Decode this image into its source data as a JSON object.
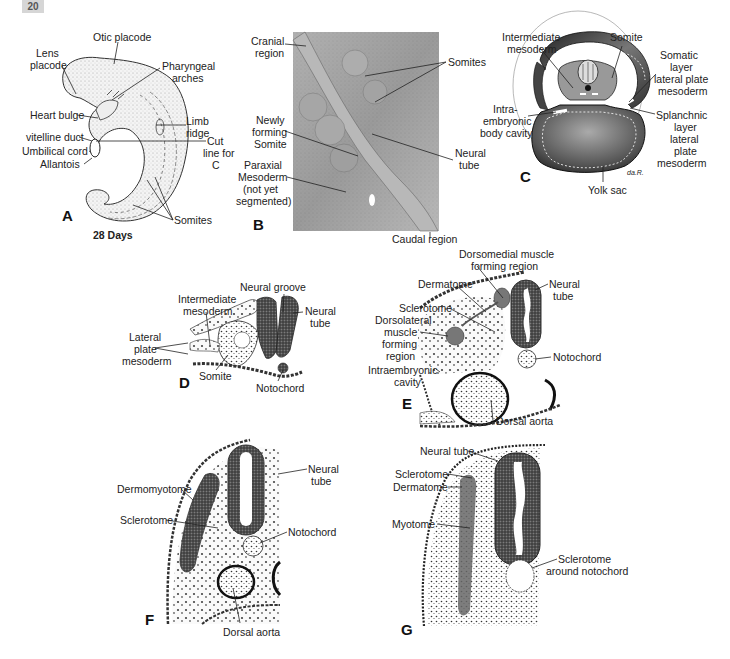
{
  "page": {
    "number": "20"
  },
  "panels": {
    "A": {
      "letter": "A",
      "caption": "28 Days",
      "labels": {
        "otic_placode": "Otic placode",
        "lens_placode_1": "Lens",
        "lens_placode_2": "placode",
        "pharyngeal_1": "Pharyngeal",
        "pharyngeal_2": "arches",
        "heart_bulge": "Heart bulge",
        "limb_ridge_1": "Limb",
        "limb_ridge_2": "ridge",
        "vitelline_duct": "vitelline duct",
        "umbilical_cord": "Umbilical cord",
        "allantois": "Allantois",
        "cut_line_1": "Cut",
        "cut_line_2": "line for",
        "cut_line_3": "C",
        "somites": "Somites"
      }
    },
    "B": {
      "letter": "B",
      "labels": {
        "cranial_1": "Cranial",
        "cranial_2": "region",
        "somites": "Somites",
        "newly_1": "Newly",
        "newly_2": "forming",
        "newly_3": "Somite",
        "neural_tube_1": "Neural",
        "neural_tube_2": "tube",
        "paraxial_1": "Paraxial",
        "paraxial_2": "Mesoderm",
        "paraxial_3": "(not yet",
        "paraxial_4": "segmented)",
        "caudal": "Caudal region"
      }
    },
    "C": {
      "letter": "C",
      "signature": "da.R.",
      "labels": {
        "intermediate_1": "Intermediate",
        "intermediate_2": "mesoderm",
        "somite": "Somite",
        "somatic_1": "Somatic",
        "somatic_2": "layer",
        "somatic_3": "lateral plate",
        "somatic_4": "mesoderm",
        "intra_1": "Intra-",
        "intra_2": "embryonic",
        "intra_3": "body cavity",
        "splanchnic_1": "Splanchnic",
        "splanchnic_2": "layer",
        "splanchnic_3": "lateral",
        "splanchnic_4": "plate",
        "splanchnic_5": "mesoderm",
        "yolk_sac": "Yolk sac"
      }
    },
    "D": {
      "letter": "D",
      "labels": {
        "neural_groove": "Neural groove",
        "intermediate_1": "Intermediate",
        "intermediate_2": "mesoderm",
        "neural_tube_1": "Neural",
        "neural_tube_2": "tube",
        "lateral_1": "Lateral",
        "lateral_2": "plate",
        "lateral_3": "mesoderm",
        "somite": "Somite",
        "notochord": "Notochord"
      }
    },
    "E": {
      "letter": "E",
      "labels": {
        "dorsomedial_1": "Dorsomedial muscle",
        "dorsomedial_2": "forming region",
        "dermatome": "Dermatome",
        "neural_tube_1": "Neural",
        "neural_tube_2": "tube",
        "sclerotome": "Sclerotome",
        "dorsolateral_1": "Dorsolateral",
        "dorsolateral_2": "muscle",
        "dorsolateral_3": "forming",
        "dorsolateral_4": "region",
        "notochord": "Notochord",
        "intraembryonic_1": "Intraembryonic",
        "intraembryonic_2": "cavity",
        "dorsal_aorta": "Dorsal aorta"
      }
    },
    "F": {
      "letter": "F",
      "labels": {
        "neural_tube_1": "Neural",
        "neural_tube_2": "tube",
        "dermomyotome": "Dermomyotome",
        "sclerotome": "Sclerotome",
        "notochord": "Notochord",
        "dorsal_aorta": "Dorsal aorta"
      }
    },
    "G": {
      "letter": "G",
      "labels": {
        "neural_tube": "Neural tube",
        "sclerotome": "Sclerotome",
        "dermatome": "Dermatome",
        "myotome": "Myotome",
        "sclerotome_notochord_1": "Sclerotome",
        "sclerotome_notochord_2": "around notochord"
      }
    }
  }
}
